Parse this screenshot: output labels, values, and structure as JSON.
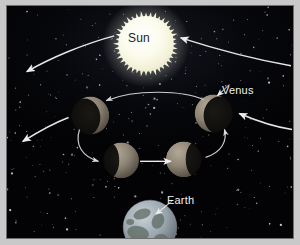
{
  "figure": {
    "background_color": "#050609",
    "frame_color": "#c9c9c9",
    "border_color": "#6e6e6e"
  },
  "labels": {
    "sun": "Sun",
    "venus": "Venus",
    "earth": "Earth"
  },
  "bodies": [
    {
      "id": "sun",
      "name": "Sun",
      "cx": 146,
      "cy": 40,
      "r": 30,
      "color": "#fdfdf2",
      "glow_color": "#ffffe0",
      "corona": true,
      "label_style": "dark"
    },
    {
      "id": "venus-upper-left",
      "name": "Venus crescent upper left",
      "cx": 88,
      "cy": 115,
      "r": 19,
      "color": "#6b6257",
      "phase": "crescent",
      "lit_side": "upper-right",
      "illumination_pct": 30
    },
    {
      "id": "venus-upper-right",
      "name": "Venus crescent upper right",
      "cx": 217,
      "cy": 113,
      "r": 19,
      "color": "#6b6257",
      "phase": "crescent",
      "lit_side": "upper-left",
      "illumination_pct": 30
    },
    {
      "id": "venus-lower-left",
      "name": "Venus gibbous lower left",
      "cx": 120,
      "cy": 161,
      "r": 18,
      "color": "#7a7064",
      "phase": "gibbous",
      "lit_side": "right",
      "illumination_pct": 70
    },
    {
      "id": "venus-lower-right",
      "name": "Venus gibbous lower right",
      "cx": 186,
      "cy": 160,
      "r": 18,
      "color": "#7a7064",
      "phase": "gibbous",
      "lit_side": "left",
      "illumination_pct": 70
    },
    {
      "id": "earth",
      "name": "Earth",
      "cx": 150,
      "cy": 228,
      "r": 28,
      "color": "#9aa4ac",
      "label_style": "light"
    }
  ],
  "arrows": [
    {
      "id": "outer-arc-left",
      "direction": "down-left",
      "color": "#e8e8e8"
    },
    {
      "id": "outer-arc-right",
      "direction": "up-left",
      "color": "#e8e8e8"
    },
    {
      "id": "mid-arc-left",
      "direction": "down-left",
      "color": "#e8e8e8"
    },
    {
      "id": "mid-arc-right",
      "direction": "left",
      "color": "#e8e8e8"
    },
    {
      "id": "inner-orbit-top",
      "direction": "left",
      "color": "#cfcfcf"
    },
    {
      "id": "inner-orbit-down-left",
      "direction": "down-right",
      "color": "#cfcfcf"
    },
    {
      "id": "inner-orbit-bottom",
      "direction": "right",
      "color": "#e8e8e8"
    },
    {
      "id": "inner-orbit-up-right",
      "direction": "up",
      "color": "#cfcfcf"
    }
  ],
  "leader_lines": [
    {
      "id": "venus-leader",
      "from_label": "Venus",
      "direction": "down-left"
    },
    {
      "id": "earth-leader",
      "from_label": "Earth",
      "direction": "down-left"
    }
  ],
  "stars": {
    "count": 300,
    "color": "#e9edf5",
    "description": "scattered white starfield"
  },
  "chart_data": {
    "type": "diagram",
    "annotations": [
      "Sun",
      "Venus",
      "Earth"
    ]
  }
}
